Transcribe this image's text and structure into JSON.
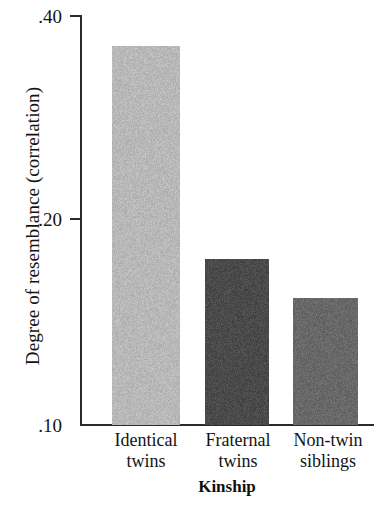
{
  "chart_data": {
    "type": "bar",
    "title": "",
    "subtitle": "",
    "xlabel": "Kinship",
    "ylabel": "Degree of resemblance (correlation)",
    "categories": [
      "Identical twins",
      "Fraternal twins",
      "Non-twin siblings"
    ],
    "category_lines": [
      [
        "Identical",
        "twins"
      ],
      [
        "Fraternal",
        "twins"
      ],
      [
        "Non-twin",
        "siblings"
      ]
    ],
    "values": [
      0.365,
      0.17,
      0.155
    ],
    "ylim": [
      0.1,
      0.4
    ],
    "ytick_labels": [
      ".40",
      ".20",
      ".10"
    ],
    "ytick_values": [
      0.4,
      0.2,
      0.1
    ],
    "grid": false,
    "legend": "none",
    "bar_colors": [
      "#b8b8b8",
      "#4a4a4a",
      "#686868"
    ],
    "axis_color": "#2b2b2b",
    "background_color": "#ffffff"
  },
  "geometry": {
    "bars": [
      {
        "left": 112,
        "width": 68,
        "top": 45
      },
      {
        "left": 205,
        "width": 64,
        "top": 258
      },
      {
        "left": 293,
        "width": 65,
        "top": 297
      }
    ],
    "ticks": [
      {
        "y": 15,
        "label_y": 7
      },
      {
        "y": 218,
        "label_y": 210
      },
      {
        "y": 424,
        "label_y": 416
      }
    ],
    "category_label_positions": [
      {
        "left": 96,
        "width": 100
      },
      {
        "left": 188,
        "width": 100
      },
      {
        "left": 278,
        "width": 100
      }
    ]
  }
}
